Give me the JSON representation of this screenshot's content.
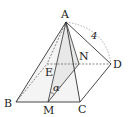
{
  "diagram": {
    "type": "square-pyramid",
    "vertices": {
      "A": {
        "label": "A",
        "x": 66,
        "y": 22
      },
      "B": {
        "label": "B",
        "x": 16,
        "y": 102
      },
      "C": {
        "label": "C",
        "x": 80,
        "y": 102
      },
      "D": {
        "label": "D",
        "x": 111,
        "y": 64
      },
      "E": {
        "label": "E",
        "x": 47,
        "y": 64
      },
      "M": {
        "label": "M",
        "x": 48,
        "y": 102
      },
      "N": {
        "label": "N",
        "x": 79,
        "y": 64
      }
    },
    "angle_label": "α",
    "edge_length_label": "4",
    "colors": {
      "line": "#333333",
      "shade": "#e6e6e6",
      "face": "#f2f2f2"
    }
  }
}
